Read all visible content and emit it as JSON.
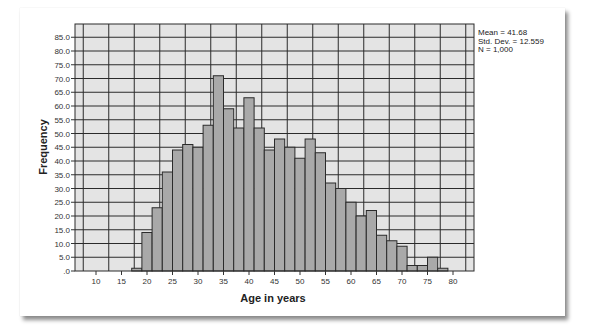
{
  "chart_data": {
    "type": "bar",
    "subtype": "histogram",
    "title": "",
    "xlabel": "Age in years",
    "ylabel": "Frequency",
    "bin_width": 2,
    "bin_starts": [
      17,
      19,
      21,
      23,
      25,
      27,
      29,
      31,
      33,
      35,
      37,
      39,
      41,
      43,
      45,
      47,
      49,
      51,
      53,
      55,
      57,
      59,
      61,
      63,
      65,
      67,
      69,
      71,
      73,
      75,
      77
    ],
    "values": [
      1,
      14,
      23,
      36,
      44,
      46,
      45,
      53,
      71,
      59,
      52,
      63,
      52,
      44,
      48,
      45,
      41,
      48,
      43,
      32,
      30,
      25,
      20,
      22,
      13,
      11,
      9,
      2,
      2,
      5,
      1
    ],
    "xlim": [
      5,
      83
    ],
    "ylim": [
      0,
      88
    ],
    "x_ticks": [
      10,
      15,
      20,
      25,
      30,
      35,
      40,
      45,
      50,
      55,
      60,
      65,
      70,
      75,
      80
    ],
    "y_ticks": [
      ".0",
      "5.0",
      "10.0",
      "15.0",
      "20.0",
      "25.0",
      "30.0",
      "35.0",
      "40.0",
      "45.0",
      "50.0",
      "55.0",
      "60.0",
      "65.0",
      "70.0",
      "75.0",
      "80.0",
      "85.0"
    ],
    "grid": true,
    "colors": {
      "bar_fill": "#a9a9a9",
      "bar_edge": "#2b2b2b",
      "plot_bg": "#e4e4e4",
      "grid": "#2b2b2b"
    },
    "annotations": {
      "mean": "Mean = 41.68",
      "std": "Std. Dev. = 12.559",
      "n": "N = 1,000"
    }
  }
}
